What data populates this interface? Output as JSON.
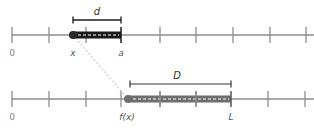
{
  "diagram": {
    "type": "number-line-mapping",
    "top_line": {
      "y": 35,
      "x_start": 12,
      "x_end": 314,
      "ticks": [
        12,
        49,
        86,
        122,
        160,
        196,
        233,
        270,
        306
      ],
      "origin_label": "0",
      "segment": {
        "start_x": 73,
        "end_x": 121,
        "start_label": "x",
        "end_label": "a",
        "length_label": "d",
        "color": "#1a1a1a"
      }
    },
    "bottom_line": {
      "y": 99,
      "x_start": 12,
      "x_end": 314,
      "ticks": [
        12,
        49,
        86,
        121,
        160,
        196,
        231,
        268,
        305
      ],
      "origin_label": "0",
      "segment": {
        "start_x": 128,
        "end_x": 231,
        "start_label": "f(x)",
        "end_label": "L",
        "length_label": "D",
        "color": "#6e6e6e"
      }
    },
    "connector": {
      "style": "dashed",
      "color": "#b0b0b0",
      "from": "x",
      "to": "f(x)"
    },
    "colors": {
      "axis": "#8c8c8c",
      "tick": "#8c8c8c",
      "top_segment": "#1a1a1a",
      "bottom_segment": "#6e6e6e",
      "dash": "#ffffff"
    }
  }
}
